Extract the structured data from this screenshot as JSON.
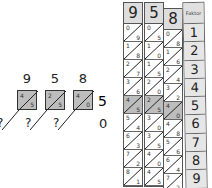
{
  "left": {
    "digits": [
      "9",
      "5",
      "8"
    ],
    "multiplier": "5",
    "cells": [
      {
        "tens": "4",
        "units": "5"
      },
      {
        "tens": "2",
        "units": "5"
      },
      {
        "tens": "4",
        "units": "0"
      }
    ],
    "carries": [
      "?",
      "?",
      "?"
    ],
    "result_last": "0"
  },
  "rods": [
    {
      "head": "9",
      "cells": [
        [
          "0",
          "9"
        ],
        [
          "1",
          "8"
        ],
        [
          "2",
          "7"
        ],
        [
          "3",
          "6"
        ],
        [
          "4",
          "5"
        ],
        [
          "5",
          "4"
        ],
        [
          "6",
          "3"
        ],
        [
          "7",
          "2"
        ],
        [
          "8",
          "1"
        ]
      ]
    },
    {
      "head": "5",
      "cells": [
        [
          "0",
          "5"
        ],
        [
          "1",
          "0"
        ],
        [
          "1",
          "5"
        ],
        [
          "2",
          "0"
        ],
        [
          "2",
          "5"
        ],
        [
          "3",
          "0"
        ],
        [
          "3",
          "5"
        ],
        [
          "4",
          "0"
        ],
        [
          "4",
          "5"
        ]
      ]
    },
    {
      "head": "8",
      "cells": [
        [
          "0",
          "8"
        ],
        [
          "1",
          "6"
        ],
        [
          "2",
          "4"
        ],
        [
          "3",
          "2"
        ],
        [
          "4",
          "0"
        ],
        [
          "4",
          "8"
        ],
        [
          "5",
          "6"
        ],
        [
          "6",
          "4"
        ],
        [
          "7",
          "2"
        ]
      ]
    }
  ],
  "highlight_row": 5,
  "factor": {
    "header": "Faktor",
    "values": [
      "1",
      "2",
      "3",
      "4",
      "5",
      "6",
      "7",
      "8",
      "9"
    ]
  }
}
